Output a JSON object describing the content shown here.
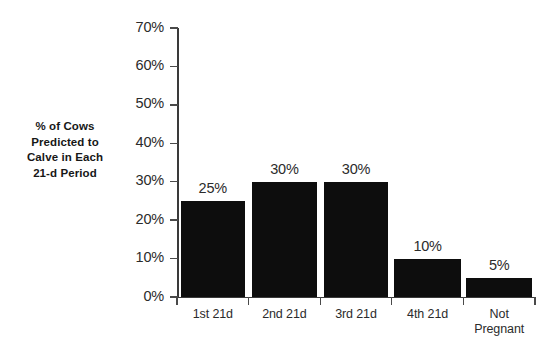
{
  "chart_data": {
    "type": "bar",
    "title": "",
    "subtitle": "",
    "xlabel": "",
    "ylabel": "% of Cows\nPredicted to\nCalve in Each\n21-d Period",
    "categories": [
      "1st 21d",
      "2nd 21d",
      "3rd 21d",
      "4th 21d",
      "Not\nPregnant"
    ],
    "values": [
      25,
      30,
      30,
      10,
      5
    ],
    "data_labels": [
      "25%",
      "30%",
      "30%",
      "10%",
      "5%"
    ],
    "ylim": [
      0,
      70
    ],
    "ytick_values": [
      0,
      10,
      20,
      30,
      40,
      50,
      60,
      70
    ],
    "ytick_labels": [
      "0%",
      "10%",
      "20%",
      "30%",
      "40%",
      "50%",
      "60%",
      "70%"
    ],
    "grid": false,
    "legend": false,
    "legend_position": "none",
    "bar_color": "#0d0d0d",
    "axis_color": "#3a3a3a",
    "background_color": "#ffffff",
    "series": [
      {
        "name": "% of Cows Predicted to Calve in Each 21-d Period",
        "values": [
          25,
          30,
          30,
          10,
          5
        ]
      }
    ]
  }
}
